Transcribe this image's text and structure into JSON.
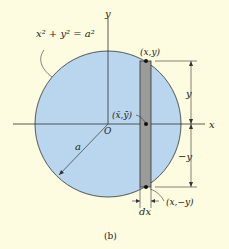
{
  "figure": {
    "caption": "(b)",
    "equation_label": "x² + y² = a²",
    "axes": {
      "x_label": "x",
      "y_label": "y",
      "origin_label": "O"
    },
    "radius_label": "a",
    "points": {
      "top": "(x,y)",
      "centroid": "(x̄,ȳ)",
      "bottom": "(x,−y)"
    },
    "dimensions": {
      "upper": "y",
      "lower": "−y",
      "width": "dx"
    },
    "colors": {
      "background": "#fdfbe0",
      "circle_fill": "#b9d6ee",
      "strip_fill": "#9b9b9b",
      "line": "#333333"
    }
  }
}
